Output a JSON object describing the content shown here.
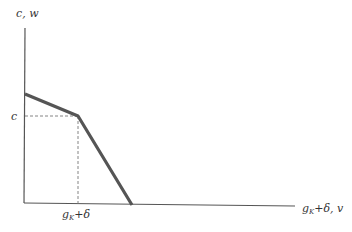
{
  "diagram": {
    "y_axis_label": "c, w",
    "x_axis_label": "gₖ+δ, v",
    "x_axis_label_main": "g",
    "x_axis_label_sub": "K",
    "x_axis_label_rest": "+δ, v",
    "c_level_label": "c",
    "kink_x_label_main": "g",
    "kink_x_label_sub": "K",
    "kink_x_label_rest": "+δ",
    "colors": {
      "axis": "#555555",
      "curve": "#555555",
      "dashed": "#777777",
      "text": "#333333"
    },
    "curve_points": [
      {
        "x": 25,
        "y": 94
      },
      {
        "x": 78,
        "y": 116
      },
      {
        "x": 132,
        "y": 205
      }
    ]
  }
}
